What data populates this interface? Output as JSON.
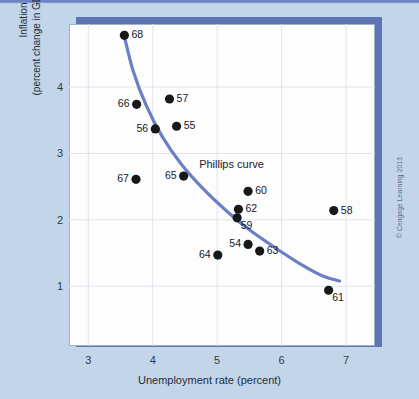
{
  "figure": {
    "credit": "© Cengage Learning 2013",
    "curve_annotation": "Phillips curve"
  },
  "colors": {
    "background": "#c3d5e8",
    "frame_blue": "#5c74b5",
    "curve_blue": "#6b80c4",
    "plot_background": "#fdfdfe",
    "grid": "#dfe4ea",
    "point": "#17181a",
    "text": "#1f2d3d"
  },
  "chart_data": {
    "type": "scatter",
    "title": "",
    "xlabel": "Unemployment rate (percent)",
    "ylabel": "Inflation rate (percent change in GDP price deflator)",
    "ylabel_lines": [
      "Inflation rate",
      "(percent change in GDP price deflator)"
    ],
    "xlim": [
      2.7,
      7.45
    ],
    "ylim": [
      0.1,
      4.95
    ],
    "xticks": [
      3,
      4,
      5,
      6,
      7
    ],
    "xtick_labels": [
      "3",
      "4",
      "5",
      "6",
      "7"
    ],
    "yticks": [
      1,
      2,
      3,
      4
    ],
    "ytick_labels": [
      "1",
      "2",
      "3",
      "4"
    ],
    "grid": true,
    "legend": "none",
    "annotations": [
      {
        "text": "Phillips curve",
        "x": 4.72,
        "y": 2.82
      }
    ],
    "points": [
      {
        "label": "68",
        "x": 3.56,
        "y": 4.78,
        "label_pos": "right"
      },
      {
        "label": "66",
        "x": 3.75,
        "y": 3.74,
        "label_pos": "left"
      },
      {
        "label": "57",
        "x": 4.26,
        "y": 3.82,
        "label_pos": "right"
      },
      {
        "label": "56",
        "x": 4.04,
        "y": 3.37,
        "label_pos": "left"
      },
      {
        "label": "55",
        "x": 4.37,
        "y": 3.41,
        "label_pos": "right"
      },
      {
        "label": "67",
        "x": 3.74,
        "y": 2.61,
        "label_pos": "left"
      },
      {
        "label": "65",
        "x": 4.48,
        "y": 2.66,
        "label_pos": "left"
      },
      {
        "label": "60",
        "x": 5.48,
        "y": 2.43,
        "label_pos": "right"
      },
      {
        "label": "62",
        "x": 5.33,
        "y": 2.16,
        "label_pos": "right"
      },
      {
        "label": "59",
        "x": 5.31,
        "y": 2.03,
        "label_pos": "below-right"
      },
      {
        "label": "58",
        "x": 6.81,
        "y": 2.14,
        "label_pos": "right"
      },
      {
        "label": "54",
        "x": 5.48,
        "y": 1.63,
        "label_pos": "left"
      },
      {
        "label": "63",
        "x": 5.66,
        "y": 1.53,
        "label_pos": "right"
      },
      {
        "label": "64",
        "x": 5.01,
        "y": 1.47,
        "label_pos": "left"
      },
      {
        "label": "61",
        "x": 6.73,
        "y": 0.94,
        "label_pos": "below-right"
      }
    ],
    "curve": {
      "name": "Phillips curve",
      "points": [
        {
          "x": 3.55,
          "y": 4.8
        },
        {
          "x": 3.7,
          "y": 4.23
        },
        {
          "x": 3.9,
          "y": 3.72
        },
        {
          "x": 4.15,
          "y": 3.25
        },
        {
          "x": 4.45,
          "y": 2.83
        },
        {
          "x": 4.8,
          "y": 2.45
        },
        {
          "x": 5.15,
          "y": 2.13
        },
        {
          "x": 5.5,
          "y": 1.85
        },
        {
          "x": 5.9,
          "y": 1.58
        },
        {
          "x": 6.3,
          "y": 1.33
        },
        {
          "x": 6.65,
          "y": 1.15
        },
        {
          "x": 6.9,
          "y": 1.08
        }
      ]
    }
  }
}
